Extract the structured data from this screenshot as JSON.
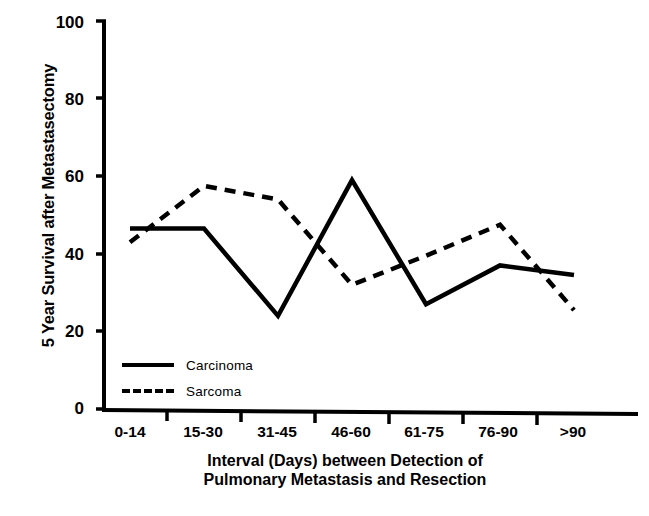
{
  "chart_data": {
    "type": "line",
    "title": "",
    "xlabel": "Interval (Days) between Detection of Pulmonary Metastasis and Resection",
    "xlabel_line1": "Interval (Days) between Detection of",
    "xlabel_line2": "Pulmonary Metastasis and Resection",
    "ylabel": "5 Year Survival after Metastasectomy",
    "categories": [
      "0-14",
      "15-30",
      "31-45",
      "46-60",
      "61-75",
      "76-90",
      ">90"
    ],
    "ylim": [
      0,
      100
    ],
    "yticks": [
      0,
      20,
      40,
      60,
      80,
      100
    ],
    "grid": false,
    "legend_position": "inside-lower-left",
    "series": [
      {
        "name": "Carcinoma",
        "style": "solid",
        "color": "#000000",
        "values": [
          46.5,
          46.5,
          24,
          59,
          27,
          37,
          34.5
        ]
      },
      {
        "name": "Sarcoma",
        "style": "dashed",
        "color": "#000000",
        "values": [
          43,
          57.5,
          54,
          32,
          39.5,
          47.5,
          25.5
        ]
      }
    ]
  },
  "axis": {
    "y_tick_labels": [
      "100",
      "80",
      "60",
      "40",
      "20",
      "0"
    ],
    "x_tick_labels": [
      "0-14",
      "15-30",
      "31-45",
      "46-60",
      "61-75",
      "76-90",
      ">90"
    ]
  },
  "legend": {
    "items": [
      {
        "label": "Carcinoma",
        "style": "solid"
      },
      {
        "label": "Sarcoma",
        "style": "dashed"
      }
    ]
  }
}
